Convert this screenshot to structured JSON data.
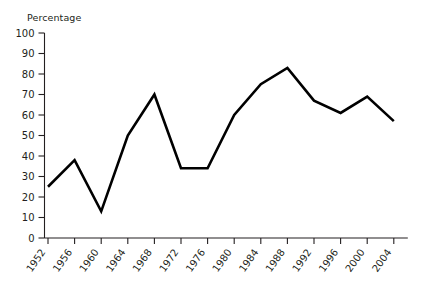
{
  "chart_data": {
    "type": "line",
    "title": "",
    "xlabel": "",
    "ylabel": "Percentage",
    "ylim": [
      0,
      100
    ],
    "ytick_step": 10,
    "yticks": [
      0,
      10,
      20,
      30,
      40,
      50,
      60,
      70,
      80,
      90,
      100
    ],
    "grid": false,
    "legend": false,
    "legend_position": "none",
    "line_color": "#000000",
    "x": [
      1952,
      1956,
      1960,
      1964,
      1968,
      1972,
      1976,
      1980,
      1984,
      1988,
      1992,
      1996,
      2000,
      2004
    ],
    "categories": [
      "1952",
      "1956",
      "1960",
      "1964",
      "1968",
      "1972",
      "1976",
      "1980",
      "1984",
      "1988",
      "1992",
      "1996",
      "2000",
      "2004"
    ],
    "values": [
      25,
      38,
      13,
      50,
      70,
      34,
      34,
      60,
      75,
      83,
      67,
      61,
      69,
      57
    ],
    "series": [
      {
        "name": "Percentage",
        "values": [
          25,
          38,
          13,
          50,
          70,
          34,
          34,
          60,
          75,
          83,
          67,
          61,
          69,
          57
        ]
      }
    ]
  },
  "axis": {
    "y_title": "Percentage",
    "y_labels": [
      "100",
      "90",
      "80",
      "70",
      "60",
      "50",
      "40",
      "30",
      "20",
      "10",
      "0"
    ],
    "x_labels": [
      "1952",
      "1956",
      "1960",
      "1964",
      "1968",
      "1972",
      "1976",
      "1980",
      "1984",
      "1988",
      "1992",
      "1996",
      "2000",
      "2004"
    ]
  }
}
